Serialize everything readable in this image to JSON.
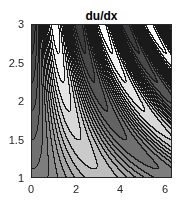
{
  "chart_data": {
    "type": "contour",
    "title": "du/dx",
    "xlabel": "",
    "ylabel": "",
    "xlim": [
      0,
      6.2832
    ],
    "ylim": [
      1,
      3
    ],
    "xticks": [
      "0",
      "2",
      "4",
      "6"
    ],
    "xtick_values": [
      0,
      2,
      4,
      6
    ],
    "yticks": [
      "1",
      "1.5",
      "2",
      "2.5",
      "3"
    ],
    "ytick_values": [
      1,
      1.5,
      2,
      2.5,
      3
    ],
    "colormap": "gray",
    "function": "-y*cos(x*y) (approximate)",
    "contour_levels": 16,
    "line_color": "#1a1a1a",
    "grid": false
  }
}
